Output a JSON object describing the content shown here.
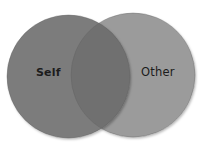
{
  "diagram": {
    "type": "venn",
    "sets": [
      {
        "id": "self",
        "label": "Self",
        "color": "#7b7b7b",
        "cx": 68.5,
        "cy": 76.5,
        "r": 61.5
      },
      {
        "id": "other",
        "label": "Other",
        "color": "#9b9b9b",
        "cx": 133,
        "cy": 75,
        "r": 62
      }
    ],
    "intersection": {
      "color": "#707070"
    },
    "background": "#ffffff",
    "label_color": "#1c1c1c"
  }
}
